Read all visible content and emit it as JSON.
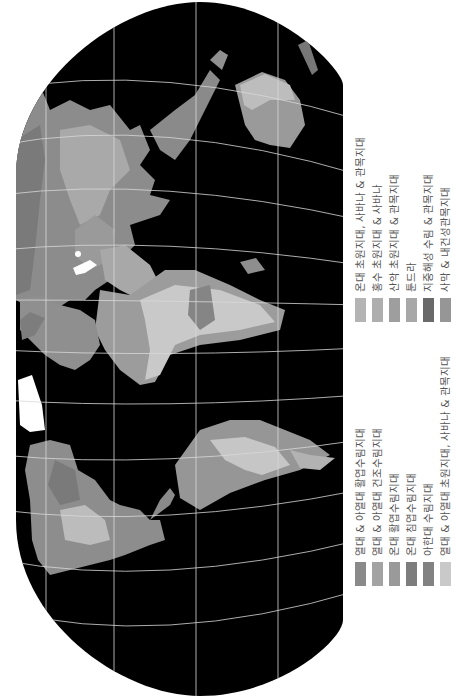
{
  "map": {
    "title": "세계 생물군계 지도",
    "background_color": "#ffffff",
    "ocean_color": "#000000",
    "graticule_color": "#d8d8d8",
    "ice_color": "#ffffff",
    "orientation": "rotated 90° counter-clockwise",
    "continents": [
      "북아메리카",
      "남아메리카",
      "유럽",
      "아프리카",
      "아시아",
      "오스트레일리아",
      "그린란드"
    ]
  },
  "legend": {
    "group_1": [
      {
        "label": "열대 & 아열대 활엽수림지대",
        "color": "#8a8a8a"
      },
      {
        "label": "열대 & 아열대 건조수림지대",
        "color": "#a3a3a3"
      },
      {
        "label": "온대 활엽수림지대",
        "color": "#9a9a9a"
      },
      {
        "label": "온대 침엽수림지대",
        "color": "#7d7d7d"
      },
      {
        "label": "아한대 수림지대",
        "color": "#828282"
      },
      {
        "label": "열대 & 아열대 초원지대, 사바나 & 관목지대",
        "color": "#c9c9c9"
      }
    ],
    "group_2": [
      {
        "label": "온대 초원지대, 사바나 & 관목지대",
        "color": "#b4b4b4"
      },
      {
        "label": "홍수 초원지대 & 사바나",
        "color": "#aeaeae"
      },
      {
        "label": "산악 초원지대 & 관목지대",
        "color": "#9e9e9e"
      },
      {
        "label": "툰드라",
        "color": "#a8a8a8"
      },
      {
        "label": "지중해성 수림 & 관목지대",
        "color": "#6a6a6a"
      },
      {
        "label": "사막 & 내건성관목지대",
        "color": "#969696"
      }
    ]
  }
}
